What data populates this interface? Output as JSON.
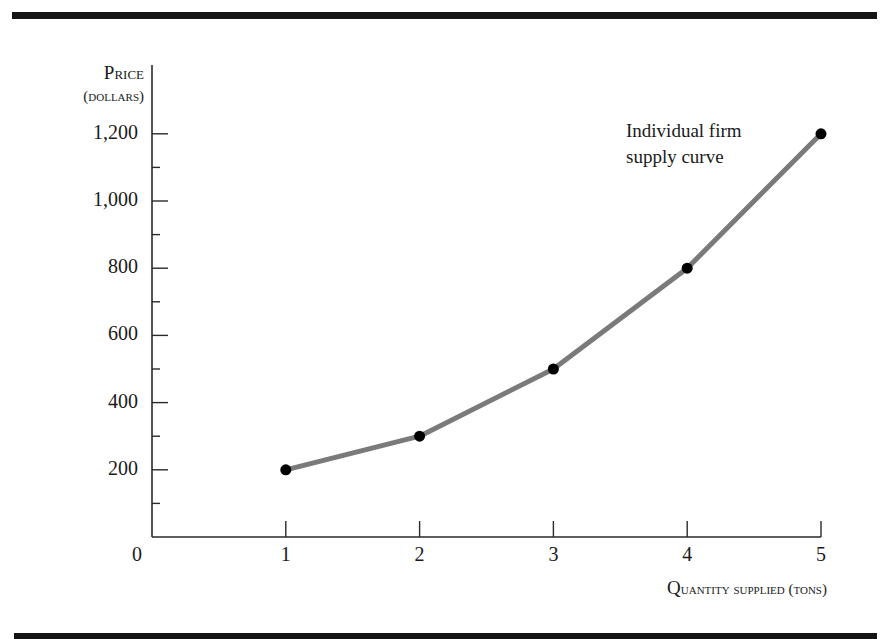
{
  "chart_data": {
    "type": "line",
    "title": "",
    "xlabel": "Quantity supplied (tons)",
    "ylabel": "Price (dollars)",
    "x": [
      1,
      2,
      3,
      4,
      5
    ],
    "series": [
      {
        "name": "Individual firm supply curve",
        "values": [
          200,
          300,
          500,
          800,
          1200
        ]
      }
    ],
    "xlim": [
      0,
      5
    ],
    "ylim": [
      0,
      1200
    ],
    "x_ticks": [
      "0",
      "1",
      "2",
      "3",
      "4",
      "5"
    ],
    "y_ticks": [
      "200",
      "400",
      "600",
      "800",
      "1,000",
      "1,200"
    ],
    "y_minor_tick_step": 100,
    "grid": false,
    "markers": true,
    "line_color": "#7a7a7a",
    "marker_color": "#000000",
    "annotations": [
      {
        "text": "Individual firm supply curve",
        "near_point": 5
      }
    ]
  },
  "labels": {
    "y_axis_line1_first": "P",
    "y_axis_line1_rest": "rice",
    "y_axis_line2": "(dollars)",
    "x_axis_first": "Q",
    "x_axis_rest": "uantity supplied (tons)",
    "origin": "0",
    "annotation_line1": "Individual firm",
    "annotation_line2": "supply curve"
  },
  "x_tick_labels": [
    "1",
    "2",
    "3",
    "4",
    "5"
  ],
  "y_tick_labels": [
    "200",
    "400",
    "600",
    "800",
    "1,000",
    "1,200"
  ]
}
